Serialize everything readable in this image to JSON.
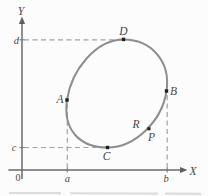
{
  "figure_type": "math-diagram",
  "axes": {
    "x_label": "X",
    "y_label": "Y",
    "origin": "0",
    "x_ticks": [
      "a",
      "b"
    ],
    "y_ticks": [
      "c",
      "d"
    ],
    "tick_a": "a",
    "tick_b": "b",
    "tick_c": "c",
    "tick_d": "d"
  },
  "points": {
    "A": "A",
    "B": "B",
    "C": "C",
    "D": "D",
    "P": "P",
    "R": "R"
  },
  "guides": [
    {
      "tick": "d",
      "point": "D",
      "orientation": "horizontal"
    },
    {
      "tick": "c",
      "point": "C",
      "orientation": "horizontal"
    },
    {
      "tick": "a",
      "point": "A",
      "orientation": "vertical"
    },
    {
      "tick": "b",
      "point": "B",
      "orientation": "vertical"
    }
  ],
  "colors": {
    "background": "#fcfcfc",
    "curve": "#8d8d8d",
    "axis": "#6a6a6a",
    "dashed_guides": "#a2a2a2",
    "dots": "#1e1e1e",
    "text": "#474747"
  }
}
